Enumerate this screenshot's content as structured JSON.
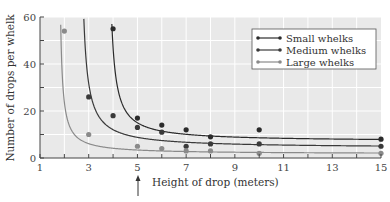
{
  "chart_data": {
    "type": "scatter",
    "title": "",
    "xlabel": "Height of drop (meters)",
    "ylabel": "Number of drops per whelk",
    "xlim": [
      1,
      15
    ],
    "ylim": [
      0,
      60
    ],
    "x_ticks": [
      1,
      3,
      5,
      7,
      9,
      11,
      13,
      15
    ],
    "y_ticks": [
      0,
      20,
      40,
      60
    ],
    "grid": true,
    "legend_position": "upper right",
    "annotations": [
      {
        "type": "arrow",
        "x": 5,
        "direction": "up",
        "location": "below x-axis"
      }
    ],
    "series": [
      {
        "name": "Small whelks",
        "color": "#2b2b2b",
        "points": [
          [
            4,
            55
          ],
          [
            5,
            17
          ],
          [
            6,
            14
          ],
          [
            7,
            12
          ],
          [
            8,
            9
          ],
          [
            10,
            12
          ],
          [
            15,
            8
          ]
        ],
        "curve": "hyperbolic fit, asymptote x≈3.9"
      },
      {
        "name": "Medium whelks",
        "color": "#3a3a3a",
        "points": [
          [
            3,
            26
          ],
          [
            4,
            18
          ],
          [
            5,
            13
          ],
          [
            6,
            11
          ],
          [
            7,
            5
          ],
          [
            8,
            6
          ],
          [
            10,
            6
          ],
          [
            15,
            5
          ]
        ],
        "curve": "hyperbolic fit, asymptote x≈2.6"
      },
      {
        "name": "Large whelks",
        "color": "#8a8a8a",
        "points": [
          [
            2,
            54
          ],
          [
            3,
            10
          ],
          [
            5,
            5
          ],
          [
            6,
            4
          ],
          [
            7,
            3
          ],
          [
            8,
            3
          ],
          [
            10,
            2
          ],
          [
            15,
            2
          ]
        ],
        "curve": "hyperbolic fit, asymptote x≈1.7"
      }
    ]
  },
  "legend": {
    "items": [
      {
        "label": "Small whelks"
      },
      {
        "label": "Medium whelks"
      },
      {
        "label": "Large whelks"
      }
    ]
  },
  "axes": {
    "x_title": "Height of drop (meters)",
    "y_title": "Number of drops per whelk",
    "x_tick_labels": [
      "1",
      "3",
      "5",
      "7",
      "9",
      "11",
      "13",
      "15"
    ],
    "y_tick_labels": [
      "0",
      "20",
      "40",
      "60"
    ]
  }
}
